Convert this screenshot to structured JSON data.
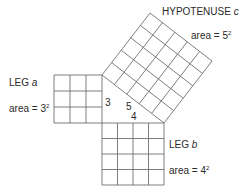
{
  "diagram": {
    "stroke_color": "#6f6f6f",
    "hypotenuse": {
      "label": "HYPOTENUSE",
      "var": "c",
      "area_prefix": "area = ",
      "area_base": "5",
      "area_exp": "2",
      "grid": 5
    },
    "leg_a": {
      "label": "LEG",
      "var": "a",
      "area_prefix": "area = ",
      "area_base": "3",
      "area_exp": "2",
      "grid": 3
    },
    "leg_b": {
      "label": "LEG",
      "var": "b",
      "area_prefix": "area = ",
      "area_base": "4",
      "area_exp": "2",
      "grid": 4
    },
    "triangle": {
      "side_a": "3",
      "side_b": "4",
      "side_c": "5"
    }
  }
}
